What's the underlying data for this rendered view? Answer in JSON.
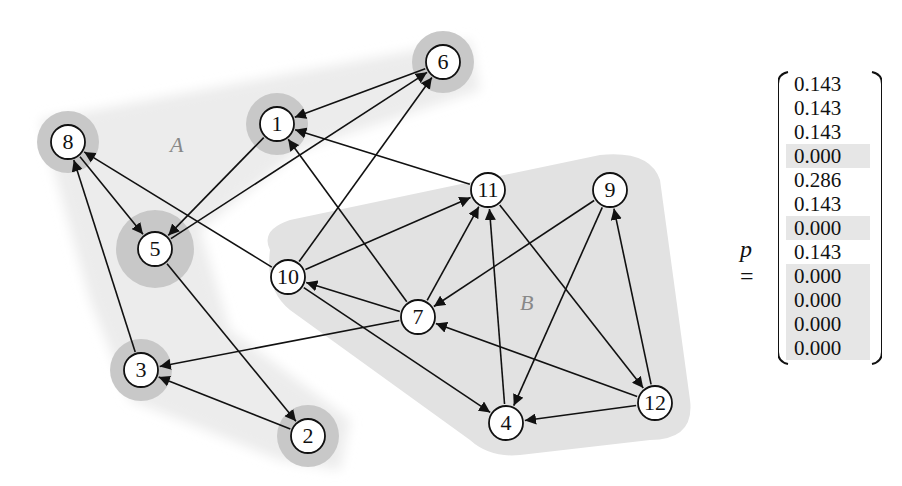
{
  "nodes": [
    {
      "id": "1",
      "x": 277,
      "y": 124,
      "halo": 14
    },
    {
      "id": "2",
      "x": 308,
      "y": 436,
      "halo": 14
    },
    {
      "id": "3",
      "x": 141,
      "y": 370,
      "halo": 14
    },
    {
      "id": "4",
      "x": 506,
      "y": 423,
      "halo": 0
    },
    {
      "id": "5",
      "x": 155,
      "y": 249,
      "halo": 22
    },
    {
      "id": "6",
      "x": 443,
      "y": 62,
      "halo": 14
    },
    {
      "id": "7",
      "x": 418,
      "y": 317,
      "halo": 0
    },
    {
      "id": "8",
      "x": 68,
      "y": 142,
      "halo": 14
    },
    {
      "id": "9",
      "x": 610,
      "y": 190,
      "halo": 0
    },
    {
      "id": "10",
      "x": 288,
      "y": 277,
      "halo": 0
    },
    {
      "id": "11",
      "x": 488,
      "y": 190,
      "halo": 0
    },
    {
      "id": "12",
      "x": 655,
      "y": 403,
      "halo": 0
    }
  ],
  "edges": [
    [
      "6",
      "1"
    ],
    [
      "1",
      "5"
    ],
    [
      "5",
      "6"
    ],
    [
      "10",
      "6"
    ],
    [
      "7",
      "1"
    ],
    [
      "11",
      "1"
    ],
    [
      "8",
      "5"
    ],
    [
      "10",
      "8"
    ],
    [
      "3",
      "8"
    ],
    [
      "5",
      "2"
    ],
    [
      "2",
      "3"
    ],
    [
      "7",
      "3"
    ],
    [
      "10",
      "11"
    ],
    [
      "7",
      "11"
    ],
    [
      "4",
      "11"
    ],
    [
      "7",
      "10"
    ],
    [
      "10",
      "4"
    ],
    [
      "9",
      "7"
    ],
    [
      "9",
      "4"
    ],
    [
      "11",
      "12"
    ],
    [
      "12",
      "9"
    ],
    [
      "12",
      "7"
    ],
    [
      "12",
      "4"
    ]
  ],
  "regions": {
    "A": {
      "label": "A",
      "x": 178,
      "y": 150
    },
    "B": {
      "label": "B",
      "x": 527,
      "y": 307
    }
  },
  "vector": {
    "label": "p",
    "equals": "=",
    "values": [
      "0.143",
      "0.143",
      "0.143",
      "0.000",
      "0.286",
      "0.143",
      "0.000",
      "0.143",
      "0.000",
      "0.000",
      "0.000",
      "0.000"
    ]
  },
  "colors": {
    "halo": "#c8c8c8",
    "regionA": "#ececec",
    "regionB": "#e2e2e2",
    "zero_highlight": "#e6e6e6"
  }
}
